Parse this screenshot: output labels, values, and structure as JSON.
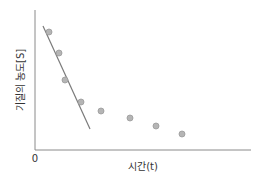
{
  "chart_data": {
    "type": "scatter",
    "title": "",
    "xlabel": "시간(t)",
    "ylabel": "기질의 농도[S]",
    "origin_label": "0",
    "grid": false,
    "legend": null,
    "x_ticks": [],
    "y_ticks": [],
    "series": [
      {
        "name": "measured points",
        "kind": "scatter",
        "points_px": [
          [
            49,
            32
          ],
          [
            59,
            53
          ],
          [
            65,
            80
          ],
          [
            81,
            102
          ],
          [
            101,
            111
          ],
          [
            130,
            118
          ],
          [
            156,
            126
          ],
          [
            182,
            134
          ]
        ],
        "x": [
          0.07,
          0.11,
          0.14,
          0.21,
          0.31,
          0.44,
          0.56,
          0.68
        ],
        "y": [
          0.86,
          0.71,
          0.5,
          0.34,
          0.28,
          0.22,
          0.17,
          0.11
        ]
      },
      {
        "name": "initial slope line",
        "kind": "line",
        "points_px": [
          [
            43,
            26
          ],
          [
            90,
            129
          ]
        ],
        "x": [
          0.04,
          0.25
        ],
        "y": [
          0.89,
          0.15
        ]
      }
    ],
    "colors": {
      "axis": "#8a8a8a",
      "point_fill": "#b5b5b5",
      "point_stroke": "#9a9a9a",
      "line": "#7a7a7a"
    },
    "axis_px": {
      "origin": [
        35,
        150
      ],
      "x_end": 251,
      "y_top": 10
    }
  }
}
